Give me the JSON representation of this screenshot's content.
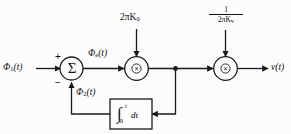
{
  "figure": {
    "type": "block-diagram",
    "background_color": "#fcfcfc",
    "line_color": "#1a1a1a"
  },
  "signals": {
    "input_label": "Φ",
    "input_sub": "1",
    "input_arg": "(t)",
    "error_label": "Φ",
    "error_sub": "e",
    "error_arg": "(t)",
    "feedback_label": "Φ",
    "feedback_sub": "2",
    "feedback_arg": "(t)",
    "output_label": "v",
    "output_arg": "(t)"
  },
  "gains": {
    "vco_gain_text": "2πK",
    "vco_gain_sub": "0",
    "scale_numerator": "1",
    "scale_den_text": "2πK",
    "scale_den_sub": "v"
  },
  "summing_junction": {
    "glyph": "Σ",
    "plus_sign": "+",
    "minus_sign": "−"
  },
  "multipliers": {
    "left_glyph": "×",
    "right_glyph": "×"
  },
  "integrator": {
    "integral_glyph": "∫",
    "upper_limit": "t",
    "lower_limit": "0",
    "differential": "dt"
  }
}
